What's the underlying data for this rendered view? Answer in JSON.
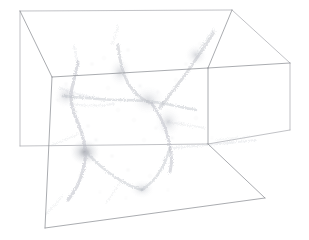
{
  "figure": {
    "name": "cosmological-simulation-volume-render",
    "title": "",
    "background_color": "#ffffff",
    "box_edge_color": "#8e9096",
    "box_edge_color_back": "#a6a8ad",
    "structure_color": "#b9bcc4",
    "dense_node_color": "#8c9099",
    "width_px": 309,
    "height_px": 240
  },
  "bounding_box": {
    "label": "simulation-volume-wireframe",
    "projection": "oblique-perspective",
    "vertices": {
      "back_top_left": [
        20,
        11
      ],
      "back_top_right": [
        232,
        10
      ],
      "right_top_back": [
        290,
        63
      ],
      "front_top_left": [
        52,
        77
      ],
      "front_top_right": [
        208,
        68
      ],
      "back_bottom_left": [
        20,
        146
      ],
      "right_bottom_back": [
        290,
        130
      ],
      "front_bottom_left": [
        45,
        228
      ],
      "front_bottom_right": [
        265,
        198
      ],
      "front_bottom_mid": [
        208,
        144
      ]
    },
    "edges": [
      "back-top-left -> back-top-right",
      "back-top-right -> right-top-back",
      "back-top-left -> front-top-left",
      "back-top-right -> front-top-right",
      "right-top-back -> front-top-right",
      "front-top-left -> front-top-right",
      "back-top-left -> back-bottom-left",
      "right-top-back -> right-bottom-back",
      "front-top-right -> front-bottom-mid",
      "back-bottom-left -> front-bottom-mid",
      "front-bottom-mid -> right-bottom-back",
      "front-top-left -> front-bottom-left",
      "front-bottom-left -> front-bottom-right",
      "front-bottom-right -> front-bottom-mid"
    ]
  },
  "chart_data": {
    "type": "scatter",
    "title": "",
    "subtitle": "",
    "xlabel": "",
    "ylabel": "",
    "zlabel": "",
    "grid": false,
    "legend_position": "none",
    "render_mode": "volume-projection",
    "colormap": "grayscale-inverted",
    "structures": [
      {
        "name": "central-filament-junction",
        "kind": "node",
        "x": 148,
        "y": 100,
        "intensity": 0.55,
        "radius": 14
      },
      {
        "name": "dense-halo-lower-left",
        "kind": "node",
        "x": 85,
        "y": 152,
        "intensity": 0.85,
        "radius": 11
      },
      {
        "name": "node-mid-right",
        "kind": "node",
        "x": 168,
        "y": 122,
        "intensity": 0.6,
        "radius": 10
      },
      {
        "name": "node-upper-mid",
        "kind": "node",
        "x": 120,
        "y": 72,
        "intensity": 0.45,
        "radius": 9
      },
      {
        "name": "node-upper-right",
        "kind": "node",
        "x": 196,
        "y": 55,
        "intensity": 0.4,
        "radius": 8
      },
      {
        "name": "node-left-sheet",
        "kind": "node",
        "x": 66,
        "y": 96,
        "intensity": 0.4,
        "radius": 9
      },
      {
        "name": "filament-vertical-left",
        "kind": "filament",
        "points": [
          [
            78,
            62
          ],
          [
            74,
            80
          ],
          [
            70,
            96
          ],
          [
            74,
            114
          ],
          [
            82,
            132
          ],
          [
            86,
            152
          ],
          [
            84,
            168
          ],
          [
            78,
            186
          ],
          [
            68,
            200
          ]
        ],
        "intensity": 0.55,
        "width": 3.2
      },
      {
        "name": "filament-upper-mid-vertical",
        "kind": "filament",
        "points": [
          [
            118,
            45
          ],
          [
            120,
            60
          ],
          [
            124,
            76
          ],
          [
            132,
            90
          ],
          [
            142,
            99
          ],
          [
            152,
            104
          ]
        ],
        "intensity": 0.5,
        "width": 2.8
      },
      {
        "name": "filament-upper-right-diagonal",
        "kind": "filament",
        "points": [
          [
            160,
            108
          ],
          [
            172,
            92
          ],
          [
            186,
            74
          ],
          [
            198,
            56
          ],
          [
            208,
            42
          ],
          [
            214,
            32
          ]
        ],
        "intensity": 0.5,
        "width": 3.0
      },
      {
        "name": "filament-horizontal-spine",
        "kind": "filament",
        "points": [
          [
            62,
            96
          ],
          [
            86,
            98
          ],
          [
            110,
            100
          ],
          [
            134,
            100
          ],
          [
            156,
            102
          ],
          [
            176,
            106
          ],
          [
            196,
            110
          ]
        ],
        "intensity": 0.45,
        "width": 2.4
      },
      {
        "name": "filament-center-to-lower-right",
        "kind": "filament",
        "points": [
          [
            152,
            104
          ],
          [
            160,
            116
          ],
          [
            166,
            130
          ],
          [
            170,
            146
          ],
          [
            172,
            160
          ],
          [
            170,
            172
          ]
        ],
        "intensity": 0.55,
        "width": 3.0
      },
      {
        "name": "filament-lower-v-left",
        "kind": "filament",
        "points": [
          [
            86,
            152
          ],
          [
            100,
            166
          ],
          [
            116,
            178
          ],
          [
            130,
            186
          ],
          [
            142,
            190
          ]
        ],
        "intensity": 0.45,
        "width": 2.6
      },
      {
        "name": "filament-lower-v-right",
        "kind": "filament",
        "points": [
          [
            142,
            190
          ],
          [
            152,
            182
          ],
          [
            160,
            172
          ],
          [
            166,
            160
          ],
          [
            170,
            148
          ]
        ],
        "intensity": 0.45,
        "width": 2.6
      },
      {
        "name": "filament-right-horizontal-lower",
        "kind": "filament",
        "points": [
          [
            174,
            148
          ],
          [
            196,
            146
          ],
          [
            218,
            144
          ],
          [
            238,
            142
          ],
          [
            256,
            140
          ]
        ],
        "intensity": 0.3,
        "width": 2.0
      },
      {
        "name": "filament-upper-left-wisp",
        "kind": "wisp",
        "points": [
          [
            74,
            46
          ],
          [
            76,
            56
          ],
          [
            78,
            64
          ]
        ],
        "intensity": 0.25,
        "width": 2.0
      },
      {
        "name": "filament-top-mid-wisp",
        "kind": "wisp",
        "points": [
          [
            112,
            44
          ],
          [
            116,
            34
          ],
          [
            118,
            26
          ]
        ],
        "intensity": 0.22,
        "width": 2.0
      },
      {
        "name": "filament-left-diagonal-upper",
        "kind": "wisp",
        "points": [
          [
            60,
            88
          ],
          [
            70,
            92
          ],
          [
            84,
            96
          ],
          [
            98,
            98
          ]
        ],
        "intensity": 0.25,
        "width": 2.0
      },
      {
        "name": "filament-bottom-left-tail",
        "kind": "wisp",
        "points": [
          [
            62,
            196
          ],
          [
            54,
            206
          ],
          [
            46,
            214
          ]
        ],
        "intensity": 0.2,
        "width": 1.8
      },
      {
        "name": "filament-right-wisp",
        "kind": "wisp",
        "points": [
          [
            216,
            140
          ],
          [
            234,
            138
          ],
          [
            250,
            136
          ]
        ],
        "intensity": 0.18,
        "width": 1.6
      },
      {
        "name": "filament-upper-right-tail",
        "kind": "wisp",
        "points": [
          [
            200,
            48
          ],
          [
            208,
            38
          ],
          [
            214,
            28
          ]
        ],
        "intensity": 0.22,
        "width": 1.8
      }
    ]
  }
}
